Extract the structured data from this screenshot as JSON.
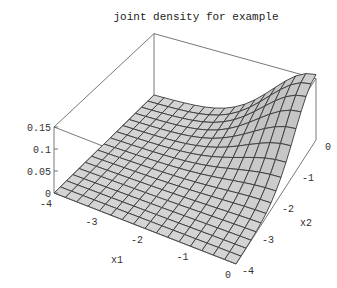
{
  "chart_data": {
    "type": "surface3d",
    "title": "joint density for example",
    "xlabel": "x1",
    "ylabel": "x2",
    "zlabel": "",
    "x_range": [
      -4,
      0
    ],
    "y_range": [
      -4,
      0
    ],
    "z_range": [
      0,
      0.15
    ],
    "x_ticks": [
      "-4",
      "-3",
      "-2",
      "-1",
      "0"
    ],
    "y_ticks": [
      "-4",
      "-3",
      "-2",
      "-1",
      "0"
    ],
    "z_ticks": [
      "0",
      "0.05",
      "0.1",
      "0.15"
    ],
    "grid_lines_per_axis": 17,
    "peak": {
      "x1": 0,
      "x2": 0,
      "z": 0.16
    },
    "colors": {
      "surface": "#d4d4d4",
      "mesh": "#3a3a3a",
      "box": "#555555",
      "background": "#ffffff"
    }
  }
}
